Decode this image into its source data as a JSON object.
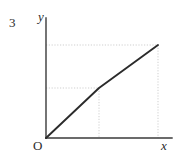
{
  "figure": {
    "background_color": "#ffffff",
    "width": 178,
    "height": 160
  },
  "labels": {
    "y_max_tick": "3",
    "y_axis": "y",
    "origin": "O",
    "x_axis": "x"
  },
  "colors": {
    "axis": "#3a3a3a",
    "curve": "#2b2b2b",
    "grid": "#c9c9c9",
    "text": "#2b2b2b"
  },
  "chart_data": {
    "type": "line",
    "title": "",
    "xlabel": "x",
    "ylabel": "y",
    "grid": true,
    "legend": "none",
    "annotations": [
      "3"
    ],
    "tick_labels": {
      "y": [
        "3"
      ],
      "x": []
    },
    "axis_origin_label": "O",
    "series": [
      {
        "name": "piecewise-linear-curve",
        "x": [
          0,
          1,
          2
        ],
        "y": [
          0,
          1,
          2
        ],
        "points_px": [
          [
            46,
            138
          ],
          [
            99,
            88
          ],
          [
            158,
            45
          ]
        ],
        "description": "Two straight segments: steeper rise from origin to a kink, then a shallower rise to the upper right endpoint."
      }
    ],
    "guide_lines": [
      {
        "orientation": "horizontal",
        "y_px": 45,
        "x_from_px": 46,
        "x_to_px": 158,
        "style": "dotted"
      },
      {
        "orientation": "horizontal",
        "y_px": 88,
        "x_from_px": 46,
        "x_to_px": 99,
        "style": "dotted"
      },
      {
        "orientation": "vertical",
        "x_px": 99,
        "y_from_px": 88,
        "y_to_px": 138,
        "style": "dotted"
      },
      {
        "orientation": "vertical",
        "x_px": 158,
        "y_from_px": 45,
        "y_to_px": 138,
        "style": "dotted"
      }
    ],
    "axes_px": {
      "y_axis": {
        "x": 46,
        "y_top": 18,
        "y_bottom": 138
      },
      "x_axis": {
        "y": 138,
        "x_left": 46,
        "x_right": 172
      }
    }
  }
}
